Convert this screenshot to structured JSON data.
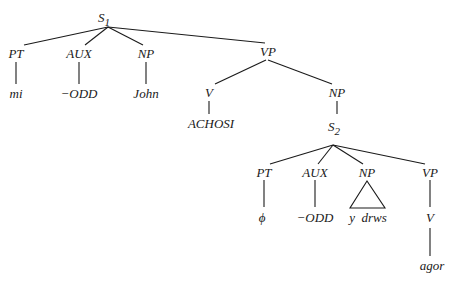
{
  "tree": {
    "root": {
      "label": "S",
      "subscript": "1"
    },
    "level1": {
      "pt": "PT",
      "aux": "AUX",
      "np": "NP",
      "vp": "VP"
    },
    "leaves1": {
      "pt": "mi",
      "aux": "−ODD",
      "np": "John"
    },
    "vp1": {
      "v": "V",
      "v_leaf": "ACHOSI",
      "np": "NP"
    },
    "embedded": {
      "label": "S",
      "subscript": "2"
    },
    "level2": {
      "pt": "PT",
      "aux": "AUX",
      "np": "NP",
      "vp": "VP"
    },
    "leaves2": {
      "pt": "ϕ",
      "aux": "−ODD",
      "np": "y  drws",
      "v": "V",
      "v_leaf": "agor"
    }
  },
  "colors": {
    "ink": "#1a1a1a",
    "background": "#ffffff"
  }
}
